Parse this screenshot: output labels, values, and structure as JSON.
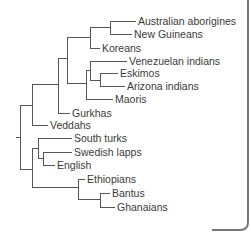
{
  "diagram": {
    "type": "phylogenetic-tree",
    "leaves": [
      {
        "id": "aus",
        "label": "Australian aborigines"
      },
      {
        "id": "ng",
        "label": "New Guineans"
      },
      {
        "id": "kor",
        "label": "Koreans"
      },
      {
        "id": "ven",
        "label": "Venezuelan indians"
      },
      {
        "id": "esk",
        "label": "Eskimos"
      },
      {
        "id": "ari",
        "label": "Arizona indians"
      },
      {
        "id": "mao",
        "label": "Maoris"
      },
      {
        "id": "gur",
        "label": "Gurkhas"
      },
      {
        "id": "ved",
        "label": "Veddahs"
      },
      {
        "id": "stu",
        "label": "South turks"
      },
      {
        "id": "swe",
        "label": "Swedish lapps"
      },
      {
        "id": "eng",
        "label": "English"
      },
      {
        "id": "eth",
        "label": "Ethiopians"
      },
      {
        "id": "ban",
        "label": "Bantus"
      },
      {
        "id": "gha",
        "label": "Ghanaians"
      }
    ],
    "topology": "(((((((Australian aborigines,New Guineans),Koreans),((Venezuelan indians,(Eskimos,Arizona indians)),Maoris)),Gurkhas),Veddahs),(((South turks,(Swedish lapps,English)),(Ethiopians,(Bantus,Ghanaians)))))"
  }
}
